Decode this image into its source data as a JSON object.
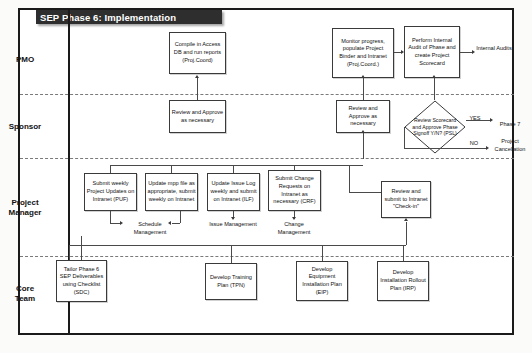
{
  "title": "SEP Phase 6: Implementation",
  "lanes": [
    {
      "label": "PMO"
    },
    {
      "label": "Sponsor"
    },
    {
      "label": "Project\nManager"
    },
    {
      "label": "Core\nTeam"
    }
  ],
  "nodes": {
    "compile_access_db": "Compile in Access DB and run reports (Proj.Coord)",
    "monitor_progress": "Monitor progress, populate Project Binder and Intranet (Proj.Coord.)",
    "perform_audit": "Perform Internal Audit of Phase and create Project Scorecard",
    "internal_audits": "Internal Audits",
    "review_approve_left": "Review and Approve as necessary",
    "review_approve_right": "Review and Approve as necessary",
    "decision_scorecard": "Review Scorecard and Approve Phase Signoff Y/N? (PSL)",
    "yes_label": "YES",
    "no_label": "NO",
    "phase_7": "Phase 7",
    "project_cancellation": "Project Cancellation",
    "submit_weekly_updates": "Submit weekly Project Updates on Intranet (PUF)",
    "update_mpp": "Update mpp file as appropriate, submit weekly on Intranet",
    "update_issue_log": "Update Issue Log weekly and submit on Intranet (ILF)",
    "submit_change_requests": "Submit Change Requests on Intranet as necessary (CRF)",
    "review_submit_checkin": "Review and submit to Intranet \"Check-in\"",
    "schedule_management": "Schedule Management",
    "issue_management": "Issue Management",
    "change_management": "Change Management",
    "tailor_deliverables": "Tailor Phase 6 SEP Deliverables using Checklist (SDC)",
    "develop_training_plan": "Develop Training Plan (TPN)",
    "develop_equipment_plan": "Develop Equipment Installation Plan (EIP)",
    "develop_rollout_plan": "Develop Installation Rollout Plan (IRP)"
  },
  "colors": {
    "title_bar": "#2e2e2e",
    "title_text": "#ffffff",
    "frame": "#1a1a1a",
    "box_border": "#3a3a3a",
    "lane_divider": "#7a7a7a"
  }
}
